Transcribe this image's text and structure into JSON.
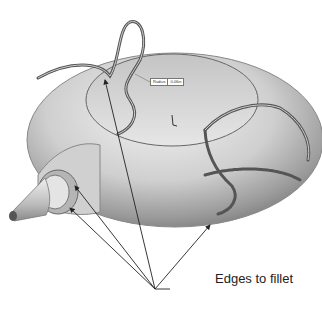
{
  "figure": {
    "background": "#ffffff",
    "body_color": "#c8c8c8",
    "edge_color": "#555555"
  },
  "callout": {
    "label": "Edges to fillet",
    "arrow_count": 4
  },
  "dimension_tag": {
    "name": "Radius",
    "value": "0.06in"
  },
  "triad": {
    "glyph": "L"
  }
}
